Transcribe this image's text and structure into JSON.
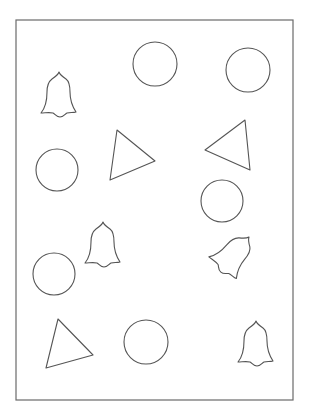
{
  "worksheet": {
    "frame": {
      "x": 16,
      "y": 20,
      "width": 277,
      "height": 380
    },
    "stroke_color": "#555555",
    "shapes": [
      {
        "type": "circle",
        "cx": 155,
        "cy": 64,
        "r": 22
      },
      {
        "type": "circle",
        "cx": 248,
        "cy": 70,
        "r": 22
      },
      {
        "type": "bell",
        "x": 59,
        "y": 72,
        "rotate": 0
      },
      {
        "type": "circle",
        "cx": 57,
        "cy": 170,
        "r": 21
      },
      {
        "type": "triangle",
        "points": "117,130 155,161 110,180"
      },
      {
        "type": "triangle",
        "points": "245,120 205,150 250,170"
      },
      {
        "type": "circle",
        "cx": 222,
        "cy": 201,
        "r": 21
      },
      {
        "type": "bell",
        "x": 103,
        "y": 222,
        "rotate": 0
      },
      {
        "type": "bell",
        "x": 249,
        "y": 237,
        "rotate": 40
      },
      {
        "type": "circle",
        "cx": 54,
        "cy": 274,
        "r": 21
      },
      {
        "type": "triangle",
        "points": "58,319 93,355 46,368"
      },
      {
        "type": "circle",
        "cx": 146,
        "cy": 342,
        "r": 22
      },
      {
        "type": "bell",
        "x": 256,
        "y": 321,
        "rotate": 0
      }
    ],
    "counts": {
      "circles": 6,
      "triangles": 3,
      "bells": 4
    }
  }
}
